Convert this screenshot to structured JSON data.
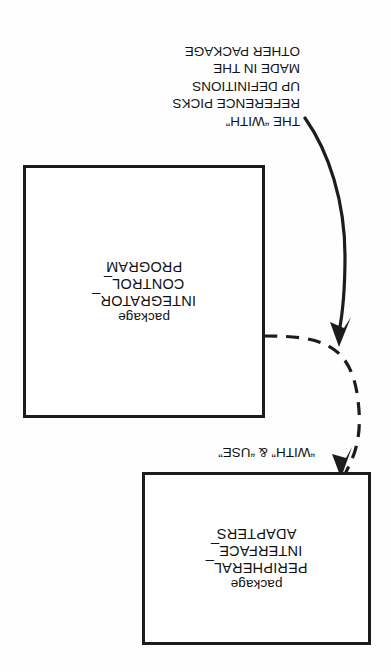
{
  "document": {
    "kind": "scanned-diagram",
    "orientation": "upside-down",
    "background_color": "#fefefe",
    "ink_color": "#1c1c1c"
  },
  "boxes": [
    {
      "id": "integrator-control-program",
      "keyword": "package",
      "name_line_1": "INTEGRATOR_",
      "name_line_2": "CONTROL_",
      "name_line_3": "PROGRAM"
    },
    {
      "id": "peripheral-interface-adapters",
      "keyword": "package",
      "name_line_1": "PERIPHERAL_",
      "name_line_2": "INTERFACE_",
      "name_line_3": "ADAPTERS"
    }
  ],
  "annotation": {
    "lines": [
      "THE “WITH”",
      "REFERENCE PICKS",
      "UP DEFINITIONS",
      "MADE IN THE",
      "OTHER PACKAGE"
    ]
  },
  "edges": [
    {
      "id": "with-use-dependency",
      "label": "“WITH” & “USE”",
      "style": "dashed",
      "from": "integrator-control-program",
      "to": "peripheral-interface-adapters",
      "arrow": "filled-triangle"
    },
    {
      "id": "annotation-pointer",
      "label": "",
      "style": "solid",
      "from": "annotation",
      "to": "with-use-dependency",
      "arrow": "filled-triangle"
    }
  ]
}
